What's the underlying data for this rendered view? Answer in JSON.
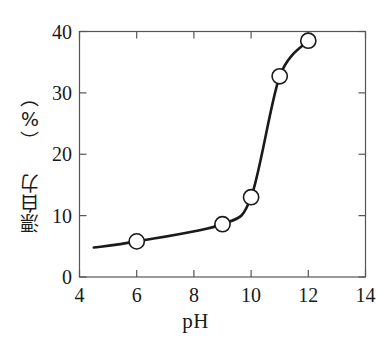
{
  "chart_data": {
    "type": "line",
    "title": "",
    "xlabel": "pH",
    "ylabel": "漂白力 （%）",
    "ylabel_parts": [
      "漂白力",
      "（%）"
    ],
    "xlim": [
      4,
      14
    ],
    "ylim": [
      0,
      40
    ],
    "xticks": [
      "4",
      "6",
      "8",
      "10",
      "12",
      "14"
    ],
    "xtick_values": [
      4,
      6,
      8,
      10,
      12,
      14
    ],
    "yticks": [
      "0",
      "10",
      "20",
      "30",
      "40"
    ],
    "ytick_values": [
      0,
      10,
      20,
      30,
      40
    ],
    "grid": false,
    "legend": null,
    "marker": "open-circle",
    "line_color": "#1a1a1a",
    "marker_face_color": "#ffffff",
    "marker_edge_color": "#1a1a1a",
    "background_color": "#ffffff",
    "frame": "box",
    "tick_direction": "in",
    "x": [
      6,
      9,
      10,
      11,
      12
    ],
    "values": [
      5.8,
      8.6,
      13.0,
      32.7,
      38.5
    ],
    "series": [
      {
        "name": "漂白力",
        "points": [
          {
            "x": 6,
            "y": 5.8
          },
          {
            "x": 9,
            "y": 8.6
          },
          {
            "x": 10,
            "y": 13.0
          },
          {
            "x": 11,
            "y": 32.7
          },
          {
            "x": 12,
            "y": 38.5
          }
        ]
      }
    ],
    "curve_start": {
      "x": 4.5,
      "y": 4.8
    },
    "annotations": []
  }
}
